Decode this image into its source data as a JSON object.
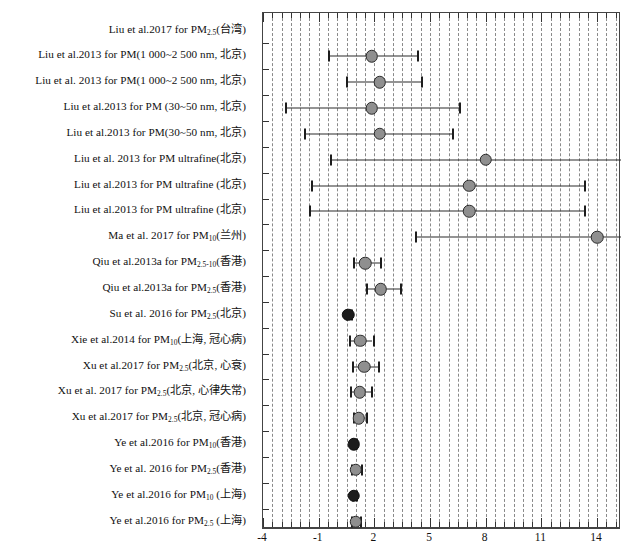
{
  "figure": {
    "type": "forest-plot",
    "title": "",
    "width": 624,
    "height": 557
  },
  "chart_data": {
    "type": "scatter",
    "plot_kind": "forest-plot",
    "title": "",
    "xlabel": "",
    "ylabel": "",
    "xlim": [
      -4,
      15.3
    ],
    "xticks": [
      -4,
      -1,
      2,
      5,
      8,
      11,
      14
    ],
    "xtick_labels": [
      "-4",
      "-1",
      "2",
      "5",
      "8",
      "11",
      "14"
    ],
    "minor_tick_step": 0.5,
    "grid": true,
    "grid_style": "dashed",
    "grid_step": 0.5,
    "legend": "none",
    "marker_color": "#8f8f8f",
    "marker_edge_color": "#2b2b2b",
    "line_color": "#2a2a2a",
    "categories": [
      "Liu et al.2017 for PM2.5(台湾)",
      "Liu et al.2013 for PM(1 000~2 500 nm, 北京)",
      "Liu et al. 2013 for PM(1 000~2 500 nm, 北京)",
      "Liu et al.2013 for PM(30~50 nm, 北京)",
      "Liu et al.2013 for PM(30~50 nm, 北京)",
      "Liu et al. 2013 for PM ultrafine(北京)",
      "Liu et al.2013 for PM ultrafine(北京)",
      "Liu et al.2013 for PM ultrafine(北京)",
      "Ma et al. 2017 for PM10(兰州)",
      "Qiu et al.2013a for PM2.5-10(香港)",
      "Qiu et al.2013a for PM2.5(香港)",
      "Su et al. 2016 for PM2.5(北京)",
      "Xie et al.2014 for PM10(上海, 冠心病)",
      "Xu et al.2017 for PM2.5(北京, 心衰)",
      "Xu et al. 2017 for PM2.5(北京, 心律失常)",
      "Xu et al.2017 for PM2.5(北京, 冠心病)",
      "Ye et al.2016 for PM10(香港)",
      "Ye et al. 2016 for PM2.5(香港)",
      "Ye et al.2016 for PM10(上海)",
      "Ye et al.2016 for PM2.5(上海)"
    ],
    "points": [
      {
        "row": 0,
        "estimate": null,
        "lower": null,
        "upper": null,
        "marker": "none"
      },
      {
        "row": 1,
        "estimate": 1.85,
        "lower": -0.5,
        "upper": 4.3,
        "marker": "circle"
      },
      {
        "row": 2,
        "estimate": 2.3,
        "lower": 0.45,
        "upper": 4.5,
        "marker": "circle"
      },
      {
        "row": 3,
        "estimate": 1.85,
        "lower": -2.8,
        "upper": 6.55,
        "marker": "circle"
      },
      {
        "row": 4,
        "estimate": 2.3,
        "lower": -1.8,
        "upper": 6.2,
        "marker": "circle"
      },
      {
        "row": 5,
        "estimate": 8.0,
        "lower": -0.4,
        "upper": 15.3,
        "marker": "circle",
        "truncated_right": true
      },
      {
        "row": 6,
        "estimate": 7.1,
        "lower": -1.4,
        "upper": 13.3,
        "marker": "circle"
      },
      {
        "row": 7,
        "estimate": 7.1,
        "lower": -1.5,
        "upper": 13.3,
        "marker": "circle"
      },
      {
        "row": 8,
        "estimate": 14.0,
        "lower": 4.2,
        "upper": 15.3,
        "marker": "circle",
        "truncated_right": true
      },
      {
        "row": 9,
        "estimate": 1.5,
        "lower": 0.85,
        "upper": 2.3,
        "marker": "circle"
      },
      {
        "row": 10,
        "estimate": 2.35,
        "lower": 1.55,
        "upper": 3.4,
        "marker": "circle"
      },
      {
        "row": 11,
        "estimate": 0.6,
        "lower": 0.45,
        "upper": 0.75,
        "marker": "circle-dark"
      },
      {
        "row": 12,
        "estimate": 1.25,
        "lower": 0.65,
        "upper": 1.9,
        "marker": "circle"
      },
      {
        "row": 13,
        "estimate": 1.45,
        "lower": 0.8,
        "upper": 2.2,
        "marker": "circle"
      },
      {
        "row": 14,
        "estimate": 1.2,
        "lower": 0.7,
        "upper": 1.8,
        "marker": "circle"
      },
      {
        "row": 15,
        "estimate": 1.15,
        "lower": 0.85,
        "upper": 1.55,
        "marker": "circle"
      },
      {
        "row": 16,
        "estimate": 0.9,
        "lower": 0.8,
        "upper": 1.0,
        "marker": "circle-dark"
      },
      {
        "row": 17,
        "estimate": 1.0,
        "lower": 0.75,
        "upper": 1.3,
        "marker": "circle"
      },
      {
        "row": 18,
        "estimate": 0.9,
        "lower": 0.8,
        "upper": 1.0,
        "marker": "circle-dark"
      },
      {
        "row": 19,
        "estimate": 1.0,
        "lower": 0.75,
        "upper": 1.25,
        "marker": "circle"
      }
    ]
  },
  "row_labels": [
    {
      "pre": "Liu et al.2017 for PM",
      "sub": "2.5",
      "post": "(台湾)"
    },
    {
      "pre": "Liu et al.2013 for PM(1 000~2 500 nm, 北京)",
      "sub": "",
      "post": ""
    },
    {
      "pre": "Liu  et  al. 2013  for  PM(1 000~2 500 nm, 北京)",
      "sub": "",
      "post": ""
    },
    {
      "pre": "Liu et al.2013 for PM (30~50 nm, 北京)",
      "sub": "",
      "post": ""
    },
    {
      "pre": "Liu et al.2013 for PM(30~50 nm, 北京)",
      "sub": "",
      "post": ""
    },
    {
      "pre": "Liu  et  al. 2013   for  PM ultrafine(北京)",
      "sub": "",
      "post": ""
    },
    {
      "pre": "Liu et al.2013 for PM ultrafine (北京)",
      "sub": "",
      "post": ""
    },
    {
      "pre": "Liu et al.2013 for PM ultrafine (北京)",
      "sub": "",
      "post": ""
    },
    {
      "pre": "Ma  et  al. 2017  for  PM",
      "sub": "10",
      "post": "(兰州)"
    },
    {
      "pre": "Qiu et al.2013a for PM",
      "sub": "2.5-10",
      "post": "(香港)"
    },
    {
      "pre": "Qiu et al.2013a for PM",
      "sub": "2.5",
      "post": "(香港)"
    },
    {
      "pre": "Su  et  al. 2016  for  PM",
      "sub": "2.5",
      "post": "(北京)"
    },
    {
      "pre": "Xie et al.2014 for PM",
      "sub": "10",
      "post": "(上海,  冠心病)"
    },
    {
      "pre": "Xu et al.2017 for PM",
      "sub": "2.5",
      "post": "(北京,  心衰)"
    },
    {
      "pre": "Xu  et  al. 2017  for  PM",
      "sub": "2.5",
      "post": "(北京,  心律失常)"
    },
    {
      "pre": "Xu et al.2017 for PM",
      "sub": "2.5",
      "post": "(北京,  冠心病)"
    },
    {
      "pre": "Ye et al.2016 for PM",
      "sub": "10",
      "post": "(香港)"
    },
    {
      "pre": "Ye  et  al. 2016  for  PM",
      "sub": "2.5",
      "post": "(香港)"
    },
    {
      "pre": "Ye et al.2016 for PM",
      "sub": "10",
      "post": " (上海)"
    },
    {
      "pre": "Ye et al.2016 for PM",
      "sub": "2.5",
      "post": " (上海)"
    }
  ]
}
